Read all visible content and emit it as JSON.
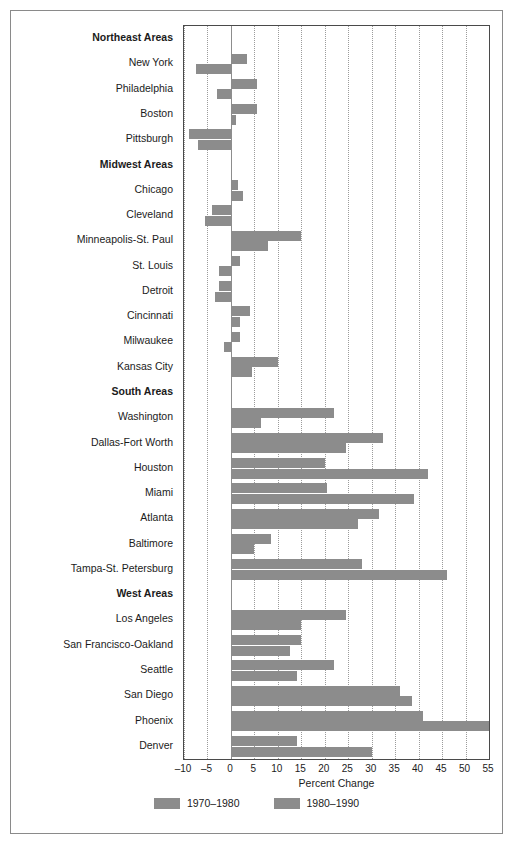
{
  "chart_data": {
    "type": "bar",
    "orientation": "horizontal",
    "title": "",
    "xlabel": "Percent Change",
    "ylabel": "",
    "xlim": [
      -10,
      55
    ],
    "xticks": [
      -10,
      -5,
      0,
      5,
      10,
      15,
      20,
      25,
      30,
      35,
      40,
      45,
      50,
      55
    ],
    "xticklabels": [
      "–10",
      "–5",
      "0",
      "5",
      "10",
      "15",
      "20",
      "25",
      "30",
      "35",
      "40",
      "45",
      "50",
      "55"
    ],
    "grid": "vertical-dotted",
    "legend": {
      "position": "bottom",
      "entries": [
        {
          "name": "1970–1980",
          "color": "#8c8c8c"
        },
        {
          "name": "1980–1990",
          "color": "#8c8c8c"
        }
      ]
    },
    "series_names": [
      "1970–1980",
      "1980–1990"
    ],
    "bar_color": "#8c8c8c",
    "rows": [
      {
        "label": "Northeast Areas",
        "group": true
      },
      {
        "label": "New York",
        "group": false,
        "values": [
          3.5,
          -7.5
        ]
      },
      {
        "label": "Philadelphia",
        "group": false,
        "values": [
          5.5,
          -3.0
        ]
      },
      {
        "label": "Boston",
        "group": false,
        "values": [
          5.5,
          1.0
        ]
      },
      {
        "label": "Pittsburgh",
        "group": false,
        "values": [
          -9.0,
          -7.0
        ]
      },
      {
        "label": "Midwest Areas",
        "group": true
      },
      {
        "label": "Chicago",
        "group": false,
        "values": [
          1.5,
          2.5
        ]
      },
      {
        "label": "Cleveland",
        "group": false,
        "values": [
          -4.0,
          -5.5
        ]
      },
      {
        "label": "Minneapolis-St. Paul",
        "group": false,
        "values": [
          15.0,
          8.0
        ]
      },
      {
        "label": "St. Louis",
        "group": false,
        "values": [
          2.0,
          -2.5
        ]
      },
      {
        "label": "Detroit",
        "group": false,
        "values": [
          -2.5,
          -3.5
        ]
      },
      {
        "label": "Cincinnati",
        "group": false,
        "values": [
          4.0,
          2.0
        ]
      },
      {
        "label": "Milwaukee",
        "group": false,
        "values": [
          2.0,
          -1.5
        ]
      },
      {
        "label": "Kansas City",
        "group": false,
        "values": [
          10.0,
          4.5
        ]
      },
      {
        "label": "South Areas",
        "group": true
      },
      {
        "label": "Washington",
        "group": false,
        "values": [
          22.0,
          6.5
        ]
      },
      {
        "label": "Dallas-Fort Worth",
        "group": false,
        "values": [
          32.5,
          24.5
        ]
      },
      {
        "label": "Houston",
        "group": false,
        "values": [
          20.0,
          42.0
        ]
      },
      {
        "label": "Miami",
        "group": false,
        "values": [
          20.5,
          39.0
        ]
      },
      {
        "label": "Atlanta",
        "group": false,
        "values": [
          31.5,
          27.0
        ]
      },
      {
        "label": "Baltimore",
        "group": false,
        "values": [
          8.5,
          5.0
        ]
      },
      {
        "label": "Tampa-St. Petersburg",
        "group": false,
        "values": [
          28.0,
          46.0
        ]
      },
      {
        "label": "West Areas",
        "group": true
      },
      {
        "label": "Los Angeles",
        "group": false,
        "values": [
          24.5,
          15.0
        ]
      },
      {
        "label": "San Francisco-Oakland",
        "group": false,
        "values": [
          15.0,
          12.5
        ]
      },
      {
        "label": "Seattle",
        "group": false,
        "values": [
          22.0,
          14.0
        ]
      },
      {
        "label": "San Diego",
        "group": false,
        "values": [
          36.0,
          38.5
        ]
      },
      {
        "label": "Phoenix",
        "group": false,
        "values": [
          41.0,
          55.0
        ]
      },
      {
        "label": "Denver",
        "group": false,
        "values": [
          14.0,
          30.0
        ]
      }
    ]
  }
}
